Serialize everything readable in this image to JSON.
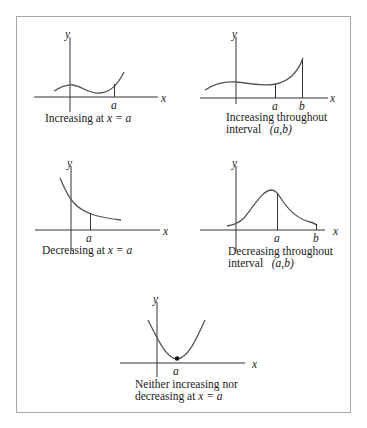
{
  "figure": {
    "panels": [
      {
        "id": "increasing-at-a",
        "axis_labels": {
          "x": "x",
          "y": "y"
        },
        "markers": [
          "a"
        ],
        "caption": {
          "line1_prefix": "Increasing at ",
          "line1_math": "x = a"
        }
      },
      {
        "id": "increasing-throughout-interval",
        "axis_labels": {
          "x": "x",
          "y": "y"
        },
        "markers": [
          "a",
          "b"
        ],
        "caption": {
          "line1": "Increasing throughout",
          "line2_prefix": "interval ",
          "line2_math": "(a,b)"
        }
      },
      {
        "id": "decreasing-at-a",
        "axis_labels": {
          "x": "x",
          "y": "y"
        },
        "markers": [
          "a"
        ],
        "caption": {
          "line1_prefix": "Decreasing at ",
          "line1_math": "x = a"
        }
      },
      {
        "id": "decreasing-throughout-interval",
        "axis_labels": {
          "x": "x",
          "y": "y"
        },
        "markers": [
          "a",
          "b"
        ],
        "caption": {
          "line1": "Decreasing throughout",
          "line2_prefix": "interval ",
          "line2_math": "(a,b)"
        }
      },
      {
        "id": "neither-at-a",
        "axis_labels": {
          "x": "x",
          "y": "y"
        },
        "markers": [
          "a"
        ],
        "caption": {
          "line1": "Neither increasing nor",
          "line2_prefix": "decreasing at ",
          "line2_math": "x = a"
        }
      }
    ],
    "colors": {
      "curve": "#555555",
      "axis": "#333333",
      "frame": "#a8a8a8"
    }
  }
}
